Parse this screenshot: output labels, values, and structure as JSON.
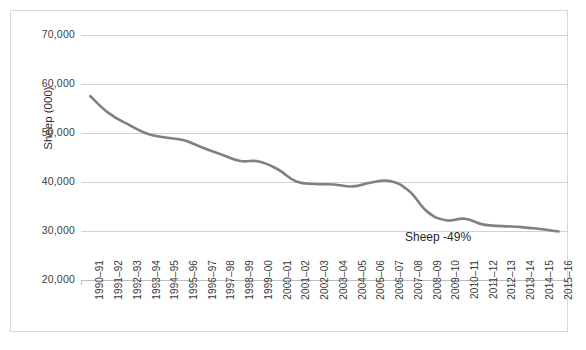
{
  "chart_data": {
    "type": "line",
    "title": "",
    "xlabel": "",
    "ylabel": "Sheep (000)",
    "ylim": [
      20000,
      70000
    ],
    "ytick_values": [
      70000,
      60000,
      50000,
      40000,
      30000,
      20000
    ],
    "ytick_labels": [
      "70,000",
      "60,000",
      "50,000",
      "40,000",
      "30,000",
      "20,000"
    ],
    "grid": true,
    "legend": "none",
    "annotations": [
      {
        "text": "Sheep -49%",
        "x_category": "2008-09",
        "y_value": 27800
      }
    ],
    "categories": [
      "1990–91",
      "1991–92",
      "1992–93",
      "1993–94",
      "1994–95",
      "1995–96",
      "1996–97",
      "1997–98",
      "1998–99",
      "1999–00",
      "2000–01",
      "2001–02",
      "2002–03",
      "2003–04",
      "2004–05",
      "2005–06",
      "2006–07",
      "2007–08",
      "2008–09",
      "2009–10",
      "2010–11",
      "2011–12",
      "2012–13",
      "2013–14",
      "2014–15",
      "2015–16"
    ],
    "series": [
      {
        "name": "Sheep",
        "color": "#808080",
        "values": [
          57500,
          54000,
          51800,
          49900,
          49100,
          48500,
          47000,
          45600,
          44300,
          44200,
          42600,
          40100,
          39600,
          39500,
          39100,
          39900,
          40200,
          38200,
          33900,
          32200,
          32500,
          31300,
          31000,
          30800,
          30400,
          29900
        ]
      }
    ]
  },
  "y_axis": {
    "title": "Sheep (000)"
  },
  "annotation": {
    "sheep_change": "Sheep -49%"
  }
}
